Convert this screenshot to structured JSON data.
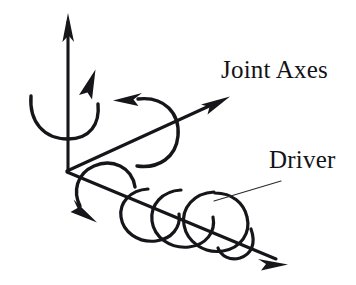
{
  "figure": {
    "type": "line-art-technical-diagram",
    "background_color": "#ffffff",
    "ink_color": "#16161a",
    "canvas": {
      "width": 356,
      "height": 285
    }
  },
  "labels": {
    "joint_axes": "Joint Axes",
    "driver": "Driver"
  },
  "origin": {
    "x": 68,
    "y": 170
  },
  "axes": [
    {
      "id": "axis-vertical",
      "name": "vertical-joint-axis",
      "from": {
        "x": 68,
        "y": 170
      },
      "to": {
        "x": 68,
        "y": 15
      },
      "arrowhead": "open-barbed",
      "direction": "up"
    },
    {
      "id": "axis-diagonal-up",
      "name": "upper-right-joint-axis",
      "from": {
        "x": 68,
        "y": 170
      },
      "to": {
        "x": 229,
        "y": 97
      },
      "arrowhead": "open-barbed",
      "direction": "up-right"
    },
    {
      "id": "axis-diagonal-down",
      "name": "lower-right-joint-axis",
      "from": {
        "x": 68,
        "y": 170
      },
      "to": {
        "x": 287,
        "y": 264
      },
      "arrowhead": "open-barbed",
      "direction": "down-right"
    }
  ],
  "rotation_arrows": [
    {
      "id": "rot-vertical",
      "name": "rotation-arc-vertical-axis",
      "about_axis": "axis-vertical",
      "arrow_tip": {
        "x": 93,
        "y": 72
      },
      "sense": "counterclockwise"
    },
    {
      "id": "rot-diagonal-up",
      "name": "rotation-arc-upper-axis",
      "about_axis": "axis-diagonal-up",
      "arrow_tip": {
        "x": 118,
        "y": 101
      },
      "sense": "counterclockwise"
    },
    {
      "id": "rot-diagonal-down",
      "name": "rotation-arc-lower-axis",
      "about_axis": "axis-diagonal-down",
      "arrow_tip": {
        "x": 92,
        "y": 216
      },
      "sense": "counterclockwise"
    }
  ],
  "driver": {
    "name": "helical-driver-coil",
    "wound_about": "axis-diagonal-down",
    "loop_count": 3,
    "loops": [
      {
        "cx": 150,
        "cy": 215,
        "r": 26
      },
      {
        "cx": 178,
        "cy": 220,
        "r": 29
      },
      {
        "cx": 208,
        "cy": 224,
        "r": 32
      }
    ],
    "leader_line": {
      "from": {
        "x": 214,
        "y": 201
      },
      "to": {
        "x": 281,
        "y": 181
      }
    }
  }
}
